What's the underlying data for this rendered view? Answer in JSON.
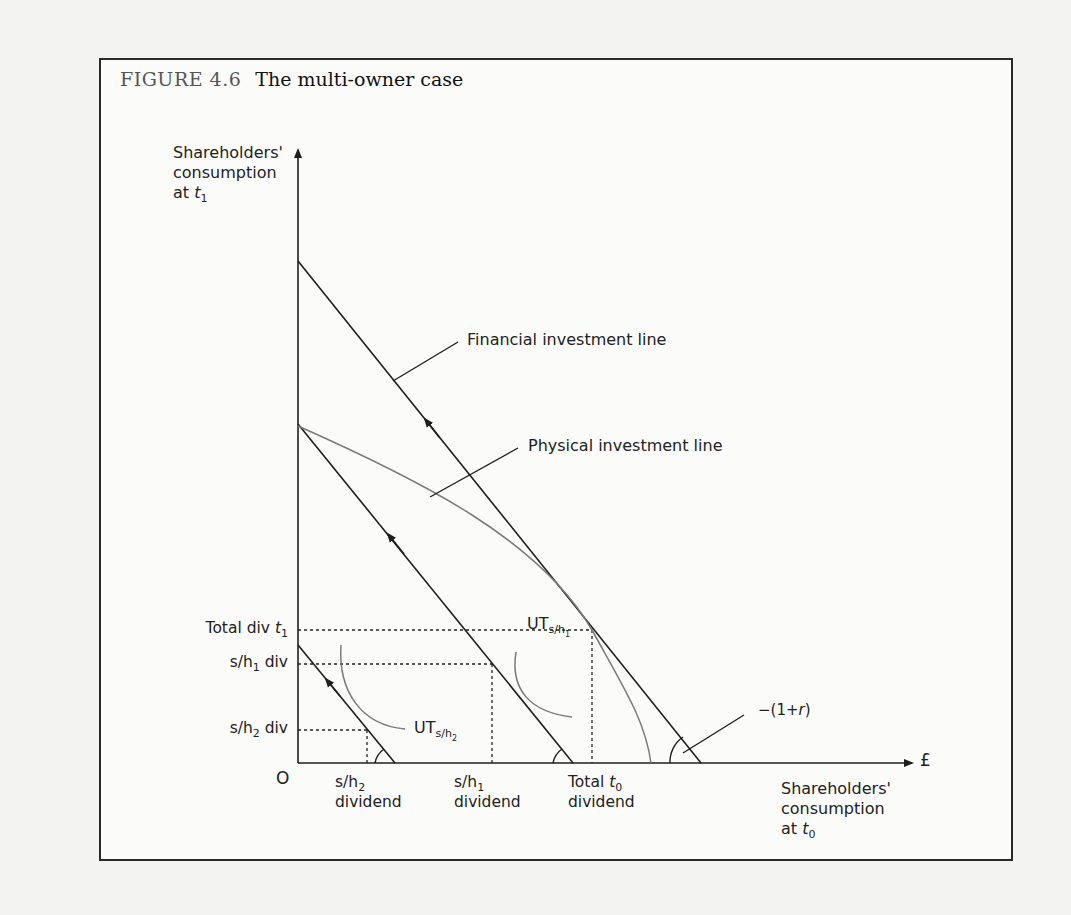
{
  "figure": {
    "number": "FIGURE 4.6",
    "caption": "The multi-owner case"
  },
  "axes": {
    "y_label_line1": "Shareholders'",
    "y_label_line2": "consumption",
    "y_label_line3_prefix": "at ",
    "y_label_var": "t",
    "y_label_sub": "1",
    "x_unit": "£",
    "x_label_line1": "Shareholders'",
    "x_label_line2": "consumption",
    "x_label_line3_prefix": "at ",
    "x_label_var": "t",
    "x_label_sub": "0",
    "origin": "O"
  },
  "y_ticks": {
    "total_div_prefix": "Total div ",
    "total_div_var": "t",
    "total_div_sub": "1",
    "sh1_prefix": "s/h",
    "sh1_sub": "1",
    "sh1_suffix": " div",
    "sh2_prefix": "s/h",
    "sh2_sub": "2",
    "sh2_suffix": " div"
  },
  "x_ticks": {
    "sh2_prefix": "s/h",
    "sh2_sub": "2",
    "sh2_line2": "dividend",
    "sh1_prefix": "s/h",
    "sh1_sub": "1",
    "sh1_line2": "dividend",
    "total_prefix": "Total ",
    "total_var": "t",
    "total_sub": "0",
    "total_line2": "dividend"
  },
  "annotations": {
    "financial_line": "Financial investment line",
    "physical_line": "Physical investment line",
    "ut1_prefix": "UT",
    "ut1_sub": "s/h",
    "ut1_subsub": "1",
    "ut2_prefix": "UT",
    "ut2_sub": "s/h",
    "ut2_subsub": "2",
    "slope": "−(1+",
    "slope_var": "r",
    "slope_close": ")"
  },
  "colors": {
    "line": "#1e1e1e",
    "curve": "#7a7a7a",
    "frame": "#2a2a2a"
  }
}
